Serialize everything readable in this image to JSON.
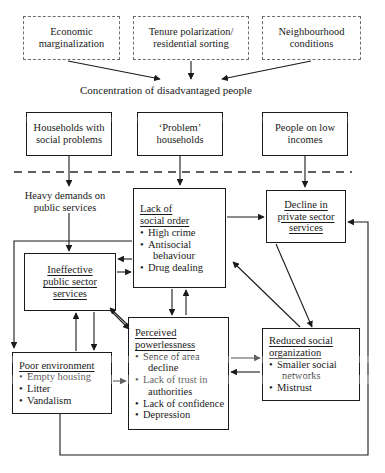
{
  "diagram": {
    "title": "Concentration of disadvantaged people",
    "top_causes": [
      {
        "id": "economic-marginalization",
        "lines": [
          "Economic",
          "marginalization"
        ]
      },
      {
        "id": "tenure-polarization",
        "lines": [
          "Tenure polarization/",
          "residential sorting"
        ]
      },
      {
        "id": "neighbourhood-conditions",
        "lines": [
          "Neighbourhood",
          "conditions"
        ]
      }
    ],
    "population_groups": [
      {
        "id": "households-social-problems",
        "lines": [
          "Households with",
          "social problems"
        ]
      },
      {
        "id": "problem-households",
        "lines": [
          "‘Problem’",
          "households"
        ]
      },
      {
        "id": "people-low-incomes",
        "lines": [
          "People on low",
          "incomes"
        ]
      }
    ],
    "heavy_demands": {
      "lines": [
        "Heavy demands on",
        "public services"
      ]
    },
    "outcomes": {
      "lack_of_social_order": {
        "heading": [
          "Lack of",
          "social order"
        ],
        "bullets": [
          "High crime",
          "Antisocial",
          "behaviour",
          "Drug dealing"
        ]
      },
      "decline_private_sector": {
        "heading": [
          "Decline in",
          "private sector",
          "services"
        ],
        "bullets": []
      },
      "ineffective_public_sector": {
        "heading": [
          "Ineffective",
          "public sector",
          "services"
        ],
        "bullets": []
      },
      "perceived_powerlessness": {
        "heading": [
          "Perceived",
          "powerlessness"
        ],
        "bullets": [
          "Sence of area",
          "decline",
          "Lack of trust in",
          "authorities",
          "Lack of confidence",
          "Depression"
        ]
      },
      "reduced_social_organization": {
        "heading": [
          "Reduced social",
          "organization"
        ],
        "bullets": [
          "Smaller social",
          "networks",
          "Mistrust"
        ]
      },
      "poor_environment": {
        "heading": [
          "Poor environment"
        ],
        "bullets": [
          "Empty housing",
          "Litter",
          "Vandalism"
        ]
      }
    },
    "divider": {
      "name": "dashed-separator",
      "style": "dashed"
    },
    "colors": {
      "ink": "#1a1a1a",
      "dashed_border": "#6d6d6d",
      "background": "#ffffff"
    }
  }
}
